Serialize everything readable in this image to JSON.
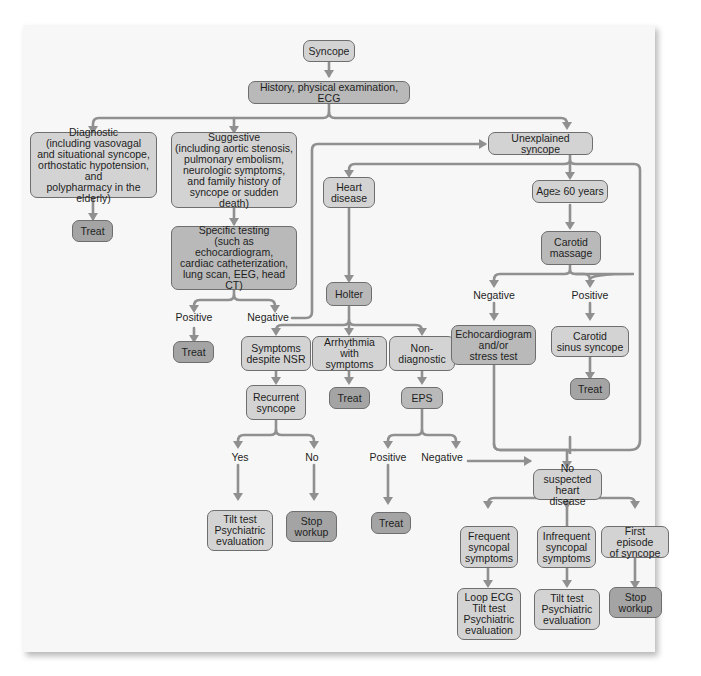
{
  "figure": {
    "colors": {
      "line": "#909090",
      "light_box": "#d3d3d3",
      "mid_box": "#b9b9b9",
      "dark_box": "#a4a4a4",
      "border": "#6e6e6e"
    }
  },
  "nodes": {
    "syncope": "Syncope",
    "history": "History, physical examination, ECG",
    "diagnostic": "Diagnostic\n(including vasovagal\nand situational syncope,\northostatic hypotension, and\npolypharmacy in the elderly)",
    "treat_diagnostic": "Treat",
    "suggestive": "Suggestive\n(including aortic stenosis,\npulmonary embolism,\nneurologic symptoms,\nand family history of\nsyncope or sudden death)",
    "specific_testing": "Specific testing\n(such as echocardiogram,\ncardiac catheterization,\nlung scan, EEG, head CT)",
    "treat_specific": "Treat",
    "unexplained": "Unexplained syncope",
    "heart_disease": "Heart\ndisease",
    "holter": "Holter",
    "symptoms_nsr": "Symptoms\ndespite NSR",
    "arrhythmia": "Arrhythmia\nwith symptoms",
    "nondiagnostic": "Non-\ndiagnostic",
    "recurrent": "Recurrent\nsyncope",
    "treat_arrhythmia": "Treat",
    "eps": "EPS",
    "tilt_recurrent": "Tilt test\nPsychiatric\nevaluation",
    "stop_recurrent": "Stop\nworkup",
    "treat_eps": "Treat",
    "age60": "Age≥ 60 years",
    "carotid_massage": "Carotid\nmassage",
    "echo_stress": "Echocardiogram\nand/or\nstress test",
    "carotid_sinus": "Carotid\nsinus syncope",
    "treat_carotid": "Treat",
    "no_heart_disease": "No suspected\nheart disease",
    "frequent": "Frequent\nsyncopal\nsymptoms",
    "infrequent": "Infrequent\nsyncopal\nsymptoms",
    "first_episode": "First episode\nof syncope",
    "loop_ecg": "Loop ECG\nTilt test\nPsychiatric\nevaluation",
    "tilt_infrequent": "Tilt test\nPsychiatric\nevaluation",
    "stop_first": "Stop\nworkup"
  },
  "labels": {
    "specific_positive": "Positive",
    "specific_negative": "Negative",
    "recurrent_yes": "Yes",
    "recurrent_no": "No",
    "eps_positive": "Positive",
    "eps_negative": "Negative",
    "carotid_negative": "Negative",
    "carotid_positive": "Positive"
  }
}
